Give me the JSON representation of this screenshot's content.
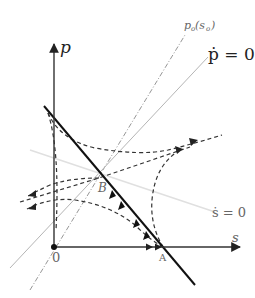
{
  "diagram": {
    "type": "phase-diagram",
    "axes": {
      "vertical_label": "p",
      "horizontal_label": "s",
      "origin_label": "0"
    },
    "curves": {
      "p_dot_zero": "ṗ = 0",
      "s_dot_zero": "ṡ = 0",
      "p_o_label_main": "p",
      "p_o_label_sub": "o",
      "p_o_label_arg_open": "(s",
      "p_o_label_arg_sub": "o",
      "p_o_label_arg_close": ")"
    },
    "points": {
      "B": "B",
      "A": "A"
    },
    "colors": {
      "axis": "#333333",
      "saddle_path": "#111111",
      "trajectory": "#333333",
      "p_dot_zero_line": "#b0b0b0",
      "s_dot_zero_line": "#dcdcdc",
      "p_o_line": "#888888"
    }
  }
}
